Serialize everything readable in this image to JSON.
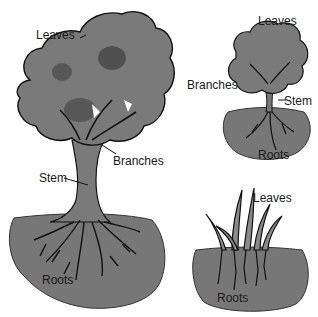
{
  "diagram": {
    "type": "labeled plant anatomy illustration",
    "colors": {
      "foliage": "#7a7a7a",
      "soil": "#777777",
      "outline": "#111111",
      "background": "#ffffff"
    },
    "plants": [
      {
        "name": "large-tree",
        "labels": {
          "leaves": "Leaves",
          "branches": "Branches",
          "stem": "Stem",
          "roots": "Roots"
        }
      },
      {
        "name": "shrub",
        "labels": {
          "leaves": "Leaves",
          "branches": "Branches",
          "stem": "Stem",
          "roots": "Roots"
        }
      },
      {
        "name": "grass",
        "labels": {
          "leaves": "Leaves",
          "roots": "Roots"
        }
      }
    ]
  }
}
